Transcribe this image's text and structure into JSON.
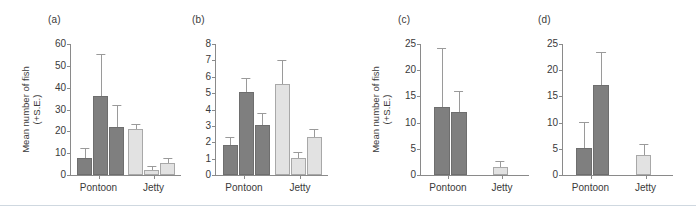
{
  "figure": {
    "width": 696,
    "height": 206,
    "background": "#ffffff",
    "dark_color": "#7f7f7f",
    "light_color": "#e2e2e2",
    "axis_color": "#8a8a8a"
  },
  "chart_data": [
    {
      "type": "bar",
      "panel_label": "(a)",
      "title": "",
      "xlabel": "",
      "ylabel": "Mean number of fish (+S.E.)",
      "ylabel_lines": [
        "Mean number of fish",
        "(+S.E.)"
      ],
      "ylim": [
        0,
        60
      ],
      "yticks": [
        0,
        10,
        20,
        30,
        40,
        50,
        60
      ],
      "ytick_labels": [
        "0",
        "10",
        "20",
        "30",
        "40",
        "50",
        "60"
      ],
      "grid": false,
      "legend": "none",
      "categories": [
        "Pontoon",
        "Jetty"
      ],
      "series": [
        {
          "name": "Pontoon",
          "group": "Pontoon",
          "color": "#7f7f7f",
          "values": [
            8,
            36,
            22
          ],
          "errors": [
            4.5,
            19.5,
            10
          ]
        },
        {
          "name": "Jetty",
          "group": "Jetty",
          "color": "#e2e2e2",
          "values": [
            21,
            2.2,
            5.5
          ],
          "errors": [
            2.3,
            2,
            2.3
          ]
        }
      ]
    },
    {
      "type": "bar",
      "panel_label": "(b)",
      "title": "",
      "xlabel": "",
      "ylabel": "",
      "ylabel_lines": [],
      "ylim": [
        0,
        8
      ],
      "yticks": [
        0,
        1,
        2,
        3,
        4,
        5,
        6,
        7,
        8
      ],
      "ytick_labels": [
        "0",
        "1",
        "2",
        "3",
        "4",
        "5",
        "6",
        "7",
        "8"
      ],
      "grid": false,
      "legend": "none",
      "categories": [
        "Pontoon",
        "Jetty"
      ],
      "series": [
        {
          "name": "Pontoon",
          "group": "Pontoon",
          "color": "#7f7f7f",
          "values": [
            1.85,
            5.05,
            3.05
          ],
          "errors": [
            0.5,
            0.85,
            0.75
          ]
        },
        {
          "name": "Jetty",
          "group": "Jetty",
          "color": "#e2e2e2",
          "values": [
            5.55,
            1.05,
            2.35
          ],
          "errors": [
            1.45,
            0.35,
            0.45
          ]
        }
      ]
    },
    {
      "type": "bar",
      "panel_label": "(c)",
      "title": "",
      "xlabel": "",
      "ylabel": "Mean number of fish (+S.E.)",
      "ylabel_lines": [
        "Mean number of fish",
        "(+S.E.)"
      ],
      "ylim": [
        0,
        25
      ],
      "yticks": [
        0,
        5,
        10,
        15,
        20,
        25
      ],
      "ytick_labels": [
        "0",
        "5",
        "10",
        "15",
        "20",
        "25"
      ],
      "grid": false,
      "legend": "none",
      "categories": [
        "Pontoon",
        "Jetty"
      ],
      "series": [
        {
          "name": "Pontoon",
          "group": "Pontoon",
          "color": "#7f7f7f",
          "values": [
            13,
            12.1
          ],
          "errors": [
            11.2,
            4
          ]
        },
        {
          "name": "Jetty",
          "group": "Jetty",
          "color": "#e2e2e2",
          "values": [
            1.5
          ],
          "errors": [
            1.2
          ]
        }
      ]
    },
    {
      "type": "bar",
      "panel_label": "(d)",
      "title": "",
      "xlabel": "",
      "ylabel": "",
      "ylabel_lines": [],
      "ylim": [
        0,
        25
      ],
      "yticks": [
        0,
        5,
        10,
        15,
        20,
        25
      ],
      "ytick_labels": [
        "0",
        "5",
        "10",
        "15",
        "20",
        "25"
      ],
      "grid": false,
      "legend": "none",
      "categories": [
        "Pontoon",
        "Jetty"
      ],
      "series": [
        {
          "name": "Pontoon",
          "group": "Pontoon",
          "color": "#7f7f7f",
          "values": [
            5.1,
            17.2
          ],
          "errors": [
            5.1,
            6.3
          ]
        },
        {
          "name": "Jetty",
          "group": "Jetty",
          "color": "#e2e2e2",
          "values": [
            3.9
          ],
          "errors": [
            2.1
          ]
        }
      ]
    }
  ]
}
